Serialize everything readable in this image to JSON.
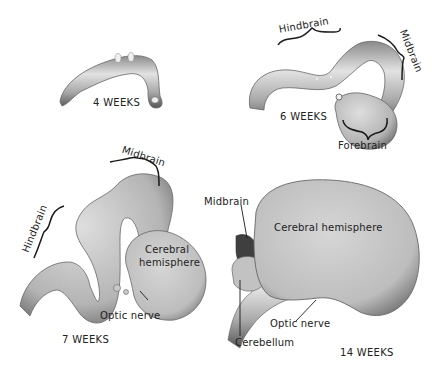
{
  "figure": {
    "stages": [
      {
        "id": "4w",
        "label": "4 WEEKS"
      },
      {
        "id": "6w",
        "label": "6 WEEKS",
        "regions": [
          "Hindbrain",
          "Midbrain",
          "Forebrain"
        ]
      },
      {
        "id": "7w",
        "label": "7 WEEKS",
        "regions": [
          "Midbrain",
          "Hindbrain",
          "Cerebral hemisphere",
          "Optic nerve"
        ]
      },
      {
        "id": "14w",
        "label": "14 WEEKS",
        "regions": [
          "Midbrain",
          "Cerebral hemisphere",
          "Optic nerve",
          "Cerebellum"
        ]
      }
    ],
    "labels": {
      "w4": "4 WEEKS",
      "w6": "6 WEEKS",
      "w6_hindbrain": "Hindbrain",
      "w6_midbrain": "Midbrain",
      "w6_forebrain": "Forebrain",
      "w7": "7 WEEKS",
      "w7_midbrain": "Midbrain",
      "w7_hindbrain": "Hindbrain",
      "w7_cerebral_1": "Cerebral",
      "w7_cerebral_2": "hemisphere",
      "w7_optic": "Optic nerve",
      "w14": "14 WEEKS",
      "w14_midbrain": "Midbrain",
      "w14_cerebral": "Cerebral hemisphere",
      "w14_optic": "Optic nerve",
      "w14_cerebellum": "Cerebellum"
    },
    "colors": {
      "tissue_light": "#d8d8d8",
      "tissue_mid": "#a9a9a9",
      "tissue_dark": "#5a5a5a",
      "ink": "#1a1a1a"
    }
  }
}
